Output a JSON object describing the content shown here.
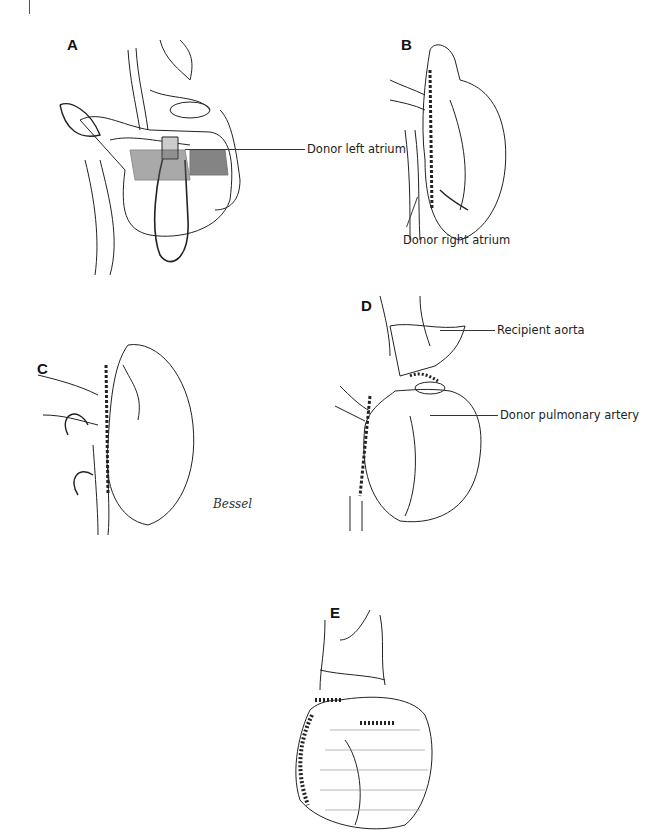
{
  "page": {
    "number_fragment": ""
  },
  "panels": [
    {
      "letter": "A",
      "labels": [
        "Donor left atrium"
      ]
    },
    {
      "letter": "B",
      "labels": [
        "Donor right atrium"
      ]
    },
    {
      "letter": "C",
      "labels": []
    },
    {
      "letter": "D",
      "labels": [
        "Recipient aorta",
        "Donor pulmonary artery"
      ]
    },
    {
      "letter": "E",
      "labels": []
    }
  ],
  "signature": "Bessel"
}
